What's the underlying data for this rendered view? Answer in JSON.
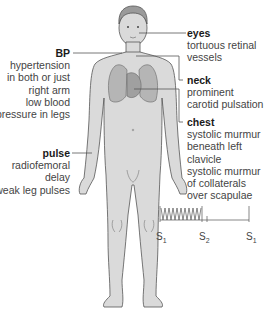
{
  "annotations": {
    "bp": {
      "title": "BP",
      "lines": [
        "hypertension",
        "in both or just",
        "right arm",
        "low blood",
        "pressure in legs"
      ]
    },
    "pulse": {
      "title": "pulse",
      "lines": [
        "radiofemoral",
        "delay",
        "weak leg pulses"
      ]
    },
    "eyes": {
      "title": "eyes",
      "lines": [
        "tortuous retinal",
        "vessels"
      ]
    },
    "neck": {
      "title": "neck",
      "lines": [
        "prominent",
        "carotid pulsation"
      ]
    },
    "chest": {
      "title": "chest",
      "lines": [
        "systolic murmur",
        "beneath left",
        "clavicle",
        "systolic murmur",
        "of collaterals",
        "over scapulae"
      ]
    }
  },
  "phonocardiogram": {
    "labels": [
      {
        "base": "S",
        "sub": "1"
      },
      {
        "base": "S",
        "sub": "2"
      },
      {
        "base": "S",
        "sub": "1"
      }
    ]
  },
  "colors": {
    "body_fill": "#d9d9d9",
    "outline": "#555555",
    "organ_fill": "#b8b8b8",
    "leader_line": "#555555"
  }
}
